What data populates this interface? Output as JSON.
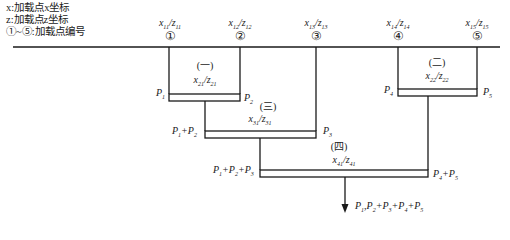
{
  "legend": {
    "x_line": "x:加载点x坐标",
    "z_line": "z:加载点z坐标",
    "num_line": "①~⑤:加载点编号"
  },
  "load_points": [
    {
      "num": "①",
      "label": "x11/z11"
    },
    {
      "num": "②",
      "label": "x12/z12"
    },
    {
      "num": "③",
      "label": "x13/z13"
    },
    {
      "num": "④",
      "label": "x14/z14"
    },
    {
      "num": "⑤",
      "label": "x15/z15"
    }
  ],
  "beams": [
    {
      "group": "(一)",
      "coord": "x21/z21",
      "left_load": "P1",
      "right_load": "P2"
    },
    {
      "group": "(二)",
      "coord": "x22/z22",
      "left_load": "P4",
      "right_load": "P5"
    },
    {
      "group": "(三)",
      "coord": "x31/z31",
      "left_load": "P1+P2",
      "right_load": "P3"
    },
    {
      "group": "(四)",
      "coord": "x41/z41",
      "left_load": "P1+P2+P3",
      "right_load": "P4+P5"
    }
  ],
  "resultant": "P1,P2+P3+P4+P5",
  "colors": {
    "line": "#1a1a1a",
    "background": "#ffffff"
  }
}
